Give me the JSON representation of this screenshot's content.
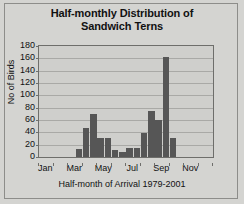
{
  "chart_data": {
    "type": "bar",
    "title": "Half-monthly Distribution of Sandwich Terns",
    "title_line1": "Half-monthly Distribution of",
    "title_line2": "Sandwich Terns",
    "xlabel": "Half-month of Arrival 1979-2001",
    "ylabel": "No of Birds",
    "ylim": [
      0,
      180
    ],
    "ytick_step": 20,
    "yticks": [
      180,
      160,
      140,
      120,
      100,
      80,
      60,
      40,
      20,
      0
    ],
    "xtick_labels": [
      "Jan",
      "Mar",
      "May",
      "Jul",
      "Sep",
      "Nov"
    ],
    "grid": true,
    "legend": false,
    "bar_color": "#565656",
    "plot_bg_color": "#cfcfcc",
    "figure_bg_color": "#d4d4d1",
    "categories": [
      "Jan 1",
      "Jan 2",
      "Feb 1",
      "Feb 2",
      "Mar 1",
      "Mar 2",
      "Apr 1",
      "Apr 2",
      "May 1",
      "May 2",
      "Jun 1",
      "Jun 2",
      "Jul 1",
      "Jul 2",
      "Aug 1",
      "Aug 2",
      "Sep 1",
      "Sep 2",
      "Oct 1",
      "Oct 2",
      "Nov 1",
      "Nov 2",
      "Dec 1",
      "Dec 2"
    ],
    "values": [
      0,
      0,
      0,
      0,
      0,
      13,
      47,
      70,
      31,
      31,
      12,
      8,
      14,
      15,
      39,
      74,
      60,
      162,
      31,
      0,
      0,
      0,
      0,
      0
    ]
  }
}
